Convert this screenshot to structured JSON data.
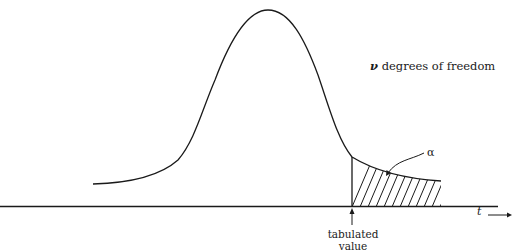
{
  "figure": {
    "labels": {
      "dof_symbol": "ν",
      "dof_text": " degrees of freedom",
      "alpha": "α",
      "x_axis": "t",
      "tabulated_line1": "tabulated",
      "tabulated_line2": "value"
    },
    "colors": {
      "ink": "#1a1a1a",
      "background": "#ffffff"
    }
  }
}
